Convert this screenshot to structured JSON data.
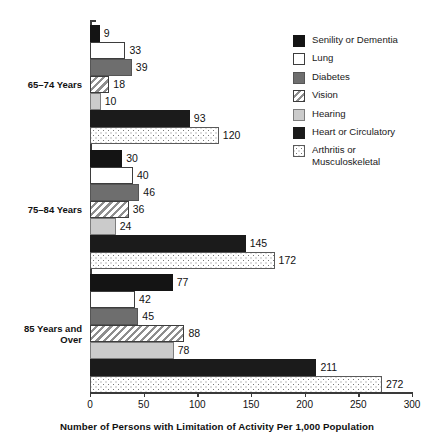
{
  "chart_data": {
    "type": "bar",
    "orientation": "horizontal",
    "title": "",
    "subtitle": "",
    "xlabel": "Number of Persons with Limitation of Activity Per 1,000 Population",
    "ylabel": "",
    "xlim": [
      0,
      300
    ],
    "xticks": [
      0,
      50,
      100,
      150,
      200,
      250,
      300
    ],
    "xtick_labels": [
      "0",
      "50",
      "100",
      "150",
      "200",
      "250",
      "300"
    ],
    "grid": false,
    "legend_position": "right",
    "categories": [
      "65–74 Years",
      "75–84 Years",
      "85 Years and\nOver"
    ],
    "series": [
      {
        "name": "Senility or Dementia",
        "pattern": "solid-black",
        "color": "#141414",
        "values": [
          9,
          30,
          77
        ]
      },
      {
        "name": "Lung",
        "pattern": "white-outline",
        "color": "#ffffff",
        "values": [
          33,
          40,
          42
        ]
      },
      {
        "name": "Diabetes",
        "pattern": "solid-medium-gray",
        "color": "#6e6e6e",
        "values": [
          39,
          46,
          45
        ]
      },
      {
        "name": "Vision",
        "pattern": "diagonal-hatch",
        "color": "#8e8e8e",
        "values": [
          18,
          36,
          88
        ]
      },
      {
        "name": "Hearing",
        "pattern": "solid-light-gray",
        "color": "#cbcbcb",
        "values": [
          10,
          24,
          78
        ]
      },
      {
        "name": "Heart or Circulatory",
        "pattern": "solid-black",
        "color": "#1b1b1b",
        "values": [
          93,
          145,
          211
        ]
      },
      {
        "name": "Arthritis or\nMusculoskeletal",
        "pattern": "dotted",
        "color": "#767676",
        "values": [
          120,
          172,
          272
        ]
      }
    ],
    "value_labels": [
      [
        "9",
        "33",
        "39",
        "18",
        "10",
        "93",
        "120"
      ],
      [
        "30",
        "40",
        "46",
        "36",
        "24",
        "145",
        "172"
      ],
      [
        "77",
        "42",
        "45",
        "88",
        "78",
        "211",
        "272"
      ]
    ]
  },
  "legend": {
    "items": [
      {
        "label": "Senility or Dementia"
      },
      {
        "label": "Lung"
      },
      {
        "label": "Diabetes"
      },
      {
        "label": "Vision"
      },
      {
        "label": "Hearing"
      },
      {
        "label": "Heart or Circulatory"
      },
      {
        "label": "Arthritis or\nMusculoskeletal"
      }
    ]
  },
  "axis": {
    "x_title": "Number of Persons with Limitation of Activity Per 1,000 Population",
    "tick_labels": [
      "0",
      "50",
      "100",
      "150",
      "200",
      "250",
      "300"
    ]
  },
  "group_labels": [
    "65–74 Years",
    "75–84 Years",
    "85 Years and\nOver"
  ]
}
